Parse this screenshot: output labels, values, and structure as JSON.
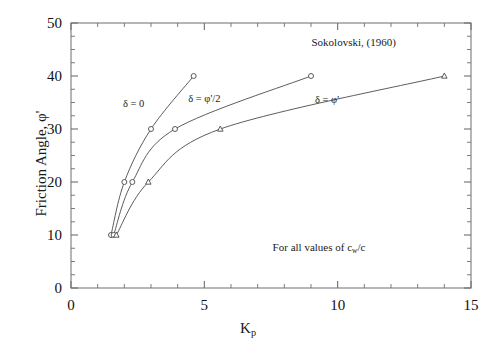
{
  "chart_data": {
    "type": "line",
    "title": "",
    "xlabel": "Kp",
    "ylabel": "Friction Angle, φ'",
    "xlim": [
      0,
      15
    ],
    "ylim": [
      0,
      50
    ],
    "xticks": [
      0,
      5,
      10,
      15
    ],
    "yticks": [
      0,
      10,
      20,
      30,
      40,
      50
    ],
    "xtick_labels": [
      "0",
      "5",
      "10",
      "15"
    ],
    "ytick_labels": [
      "0",
      "10",
      "20",
      "30",
      "40",
      "50"
    ],
    "x_minor_step": 1,
    "y_minor_step": 2.5,
    "grid": false,
    "legend": "none",
    "frame": true,
    "series": [
      {
        "name": "δ = 0",
        "marker": "circle",
        "x": [
          1.5,
          2.0,
          3.0,
          4.6
        ],
        "y": [
          10,
          20,
          30,
          40
        ]
      },
      {
        "name": "δ = φ'/2",
        "marker": "circle",
        "x": [
          1.6,
          2.3,
          3.9,
          9.0
        ],
        "y": [
          10,
          20,
          30,
          40
        ]
      },
      {
        "name": "δ = φ'",
        "marker": "triangle",
        "x": [
          1.7,
          2.9,
          5.6,
          14.0
        ],
        "y": [
          10,
          20,
          30,
          40
        ]
      }
    ],
    "annotations": [
      {
        "text": "Sokolovski, (1960)",
        "x": 10.6,
        "y": 46.5
      },
      {
        "text": "For all values of c",
        "x": 9.3,
        "y": 7.5
      }
    ],
    "curve_labels": [
      {
        "text": "δ = 0",
        "x": 2.35,
        "y": 35.0
      },
      {
        "text": "δ = φ'/2",
        "x": 5.0,
        "y": 35.8
      },
      {
        "text": "δ = φ'",
        "x": 9.6,
        "y": 35.6
      }
    ]
  },
  "axes": {
    "y_title_text": "Friction Angle, φ'",
    "x_title_main": "K",
    "x_title_sub": "p"
  },
  "annotations": {
    "source_note": "Sokolovski, (1960)",
    "values_note_prefix": "For all values of c",
    "values_note_sub": "w",
    "values_note_suffix": "/c"
  },
  "curves": {
    "delta_zero_label": "δ = 0",
    "delta_half_label": "δ = φ'/2",
    "delta_full_label": "δ = φ'"
  },
  "colors": {
    "axis": "#6e6e6e",
    "curve": "#4a4a4a",
    "text": "#111111",
    "background": "#ffffff"
  }
}
